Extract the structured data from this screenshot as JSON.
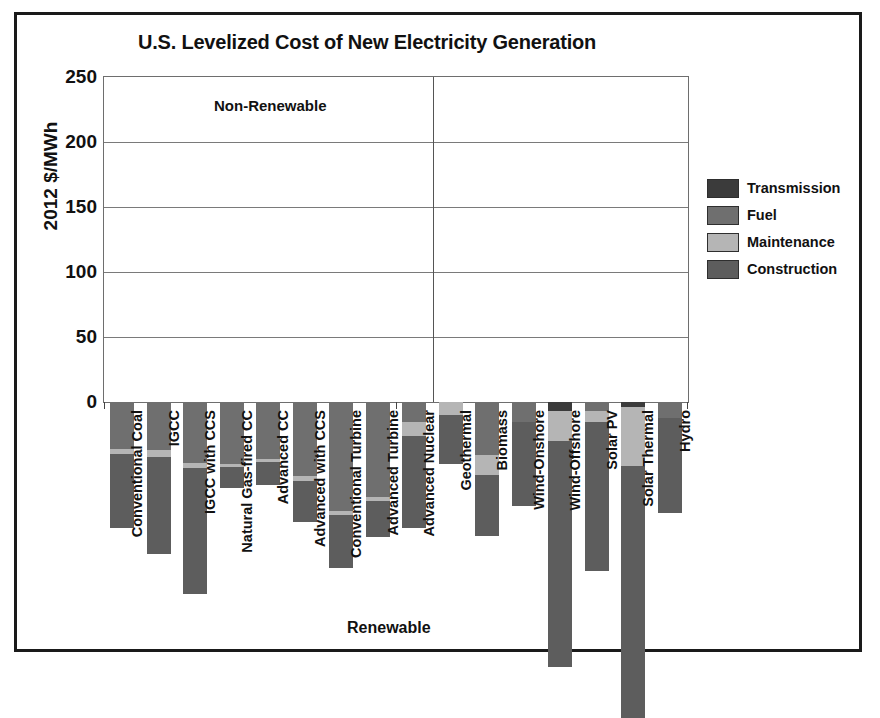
{
  "chart_data": {
    "type": "bar",
    "stacked": true,
    "title": "U.S. Levelized Cost of New Electricity Generation",
    "xlabel": "Renewable",
    "ylabel": "2012 $/MWh",
    "ylim": [
      0,
      250
    ],
    "yticks": [
      0,
      50,
      100,
      150,
      200,
      250
    ],
    "grid": true,
    "legend_position": "right",
    "group_labels": [
      "Non-Renewable",
      "Renewable"
    ],
    "categories": [
      "Conventional Coal",
      "IGCC",
      "IGCC with CCS",
      "Natural Gas-fired CC",
      "Advanced CC",
      "Advanced with CCS",
      "Conventional Turbine",
      "Advanced Turbine",
      "Advanced Nuclear",
      "Geothermal",
      "Biomass",
      "Wind-Onshore",
      "Wind-Offshore",
      "Solar PV",
      "Solar Thermal",
      "Hydro"
    ],
    "series": [
      {
        "name": "Construction",
        "color": "#5d5d5d",
        "values": [
          57,
          75,
          97,
          16,
          18,
          31,
          41,
          28,
          71,
          38,
          47,
          65,
          174,
          115,
          194,
          73
        ]
      },
      {
        "name": "Maintenance",
        "color": "#b5b5b5",
        "values": [
          4,
          5,
          4,
          2,
          2,
          4,
          3,
          3,
          11,
          10,
          15,
          0,
          23,
          8,
          45,
          0
        ]
      },
      {
        "name": "Fuel",
        "color": "#6f6f6f",
        "values": [
          36,
          37,
          47,
          48,
          44,
          57,
          84,
          73,
          15,
          0,
          41,
          15,
          0,
          7,
          0,
          12
        ]
      },
      {
        "name": "Transmission",
        "color": "#3b3b3b",
        "values": [
          0,
          0,
          0,
          0,
          0,
          0,
          0,
          0,
          0,
          0,
          0,
          0,
          7,
          0,
          4,
          0
        ]
      }
    ],
    "totals": [
      97,
      117,
      148,
      66,
      64,
      92,
      128,
      104,
      97,
      48,
      103,
      80,
      204,
      130,
      243,
      85
    ]
  }
}
